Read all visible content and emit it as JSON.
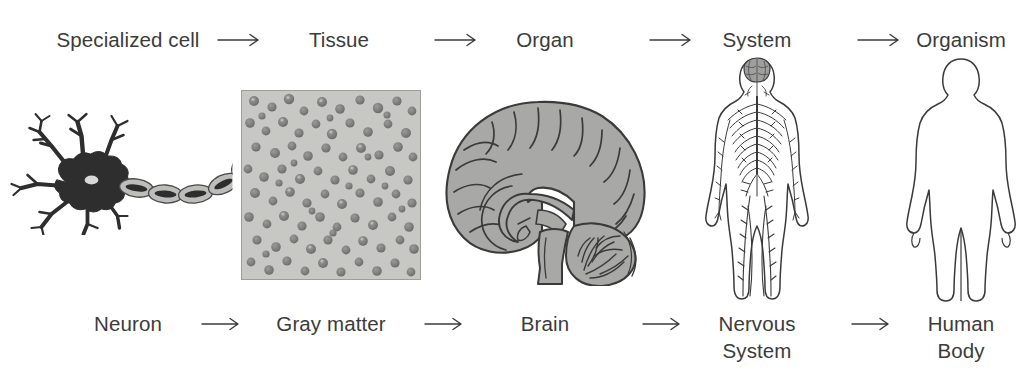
{
  "meta": {
    "background_color": "#ffffff",
    "text_color": "#3b3b3b",
    "figure_gray": "#a8a8a6",
    "figure_outline": "#3a3a3a"
  },
  "top_row": {
    "items": [
      {
        "label": "Specialized cell",
        "line2": ""
      },
      {
        "label": "Tissue",
        "line2": ""
      },
      {
        "label": "Organ",
        "line2": ""
      },
      {
        "label": "System",
        "line2": ""
      },
      {
        "label": "Organism",
        "line2": ""
      }
    ],
    "arrow_glyph": "→"
  },
  "bottom_row": {
    "items": [
      {
        "label": "Neuron",
        "line2": ""
      },
      {
        "label": "Gray matter",
        "line2": ""
      },
      {
        "label": "Brain",
        "line2": ""
      },
      {
        "label": "Nervous",
        "line2": "System"
      },
      {
        "label": "Human",
        "line2": "Body"
      }
    ],
    "arrow_glyph": "→"
  },
  "figures": [
    {
      "name": "neuron-illustration",
      "caption": "Neuron"
    },
    {
      "name": "gray-matter-micrograph",
      "caption": "Gray matter"
    },
    {
      "name": "brain-illustration",
      "caption": "Brain"
    },
    {
      "name": "nervous-system-illustration",
      "caption": "Nervous System"
    },
    {
      "name": "human-body-illustration",
      "caption": "Human Body"
    }
  ]
}
